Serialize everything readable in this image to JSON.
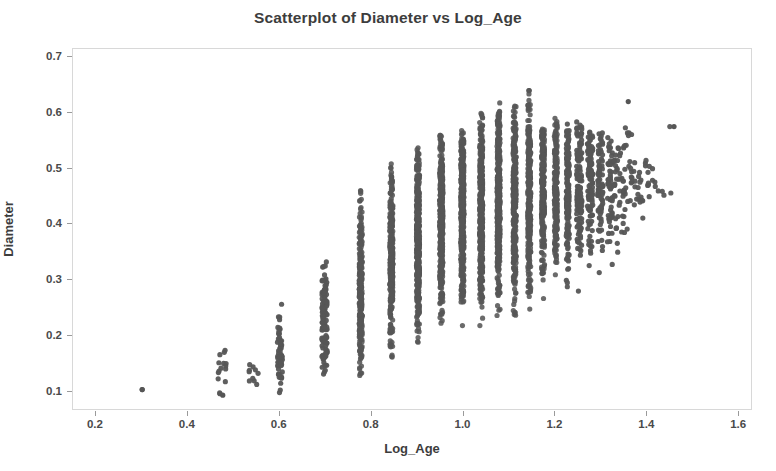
{
  "chart_data": {
    "type": "scatter",
    "title": "Scatterplot of Diameter vs Log_Age",
    "xlabel": "Log_Age",
    "ylabel": "Diameter",
    "xlim": [
      0.15,
      1.63
    ],
    "ylim": [
      0.065,
      0.715
    ],
    "xticks": [
      0.2,
      0.4,
      0.6,
      0.8,
      1.0,
      1.2,
      1.4,
      1.6
    ],
    "xticklabels": [
      "0.2",
      "0.4",
      "0.6",
      "0.8",
      "1.0",
      "1.2",
      "1.4",
      "1.6"
    ],
    "yticks": [
      0.1,
      0.2,
      0.3,
      0.4,
      0.5,
      0.6,
      0.7
    ],
    "yticklabels": [
      "0.1",
      "0.2",
      "0.3",
      "0.4",
      "0.5",
      "0.6",
      "0.7"
    ],
    "grid": false,
    "legend": null,
    "marker": "circle",
    "marker_color": "#565656",
    "marker_size": 5,
    "frame_color": "#d8d8d8",
    "background": "#ffffff",
    "columns": [
      {
        "x": 0.301,
        "n": 1,
        "ymin": 0.1,
        "ymax": 0.1,
        "ymode": 0.1
      },
      {
        "x": 0.477,
        "n": 15,
        "ymin": 0.09,
        "ymax": 0.175,
        "ymode": 0.13
      },
      {
        "x": 0.544,
        "n": 10,
        "ymin": 0.095,
        "ymax": 0.15,
        "ymode": 0.12
      },
      {
        "x": 0.602,
        "n": 60,
        "ymin": 0.09,
        "ymax": 0.265,
        "ymode": 0.165
      },
      {
        "x": 0.699,
        "n": 115,
        "ymin": 0.11,
        "ymax": 0.335,
        "ymode": 0.23
      },
      {
        "x": 0.778,
        "n": 260,
        "ymin": 0.12,
        "ymax": 0.475,
        "ymode": 0.29
      },
      {
        "x": 0.845,
        "n": 330,
        "ymin": 0.15,
        "ymax": 0.51,
        "ymode": 0.335
      },
      {
        "x": 0.903,
        "n": 400,
        "ymin": 0.175,
        "ymax": 0.54,
        "ymode": 0.375
      },
      {
        "x": 0.954,
        "n": 430,
        "ymin": 0.19,
        "ymax": 0.56,
        "ymode": 0.4
      },
      {
        "x": 1.0,
        "n": 450,
        "ymin": 0.2,
        "ymax": 0.57,
        "ymode": 0.42
      },
      {
        "x": 1.041,
        "n": 420,
        "ymin": 0.215,
        "ymax": 0.6,
        "ymode": 0.43
      },
      {
        "x": 1.079,
        "n": 390,
        "ymin": 0.22,
        "ymax": 0.62,
        "ymode": 0.44
      },
      {
        "x": 1.114,
        "n": 350,
        "ymin": 0.23,
        "ymax": 0.62,
        "ymode": 0.45
      },
      {
        "x": 1.146,
        "n": 300,
        "ymin": 0.24,
        "ymax": 0.64,
        "ymode": 0.455
      },
      {
        "x": 1.176,
        "n": 255,
        "ymin": 0.25,
        "ymax": 0.58,
        "ymode": 0.46
      },
      {
        "x": 1.204,
        "n": 210,
        "ymin": 0.255,
        "ymax": 0.59,
        "ymode": 0.465
      },
      {
        "x": 1.23,
        "n": 170,
        "ymin": 0.265,
        "ymax": 0.58,
        "ymode": 0.47
      },
      {
        "x": 1.255,
        "n": 135,
        "ymin": 0.275,
        "ymax": 0.585,
        "ymode": 0.47
      },
      {
        "x": 1.279,
        "n": 105,
        "ymin": 0.28,
        "ymax": 0.575,
        "ymode": 0.475
      },
      {
        "x": 1.301,
        "n": 80,
        "ymin": 0.3,
        "ymax": 0.57,
        "ymode": 0.475
      },
      {
        "x": 1.322,
        "n": 58,
        "ymin": 0.31,
        "ymax": 0.56,
        "ymode": 0.475
      },
      {
        "x": 1.342,
        "n": 40,
        "ymin": 0.345,
        "ymax": 0.555,
        "ymode": 0.47
      },
      {
        "x": 1.362,
        "n": 26,
        "ymin": 0.365,
        "ymax": 0.62,
        "ymode": 0.47
      },
      {
        "x": 1.38,
        "n": 16,
        "ymin": 0.39,
        "ymax": 0.53,
        "ymode": 0.465
      },
      {
        "x": 1.398,
        "n": 10,
        "ymin": 0.4,
        "ymax": 0.52,
        "ymode": 0.46
      },
      {
        "x": 1.415,
        "n": 6,
        "ymin": 0.43,
        "ymax": 0.52,
        "ymode": 0.47
      },
      {
        "x": 1.431,
        "n": 4,
        "ymin": 0.44,
        "ymax": 0.49,
        "ymode": 0.465
      },
      {
        "x": 1.462,
        "n": 2,
        "ymin": 0.455,
        "ymax": 0.575,
        "ymode": 0.515
      }
    ],
    "notable_points": [
      {
        "x": 0.301,
        "y": 0.1,
        "note": "isolated lowest-age observation"
      },
      {
        "x": 1.146,
        "y": 0.64,
        "note": "maximum diameter"
      },
      {
        "x": 1.362,
        "y": 0.62,
        "note": "high-age large-diameter outlier"
      },
      {
        "x": 1.462,
        "y": 0.575,
        "note": "rightmost observation"
      },
      {
        "x": 0.477,
        "y": 0.09,
        "note": "minimum diameter"
      }
    ]
  }
}
